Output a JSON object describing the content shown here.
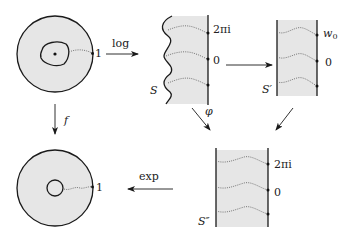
{
  "diagram": {
    "labels": {
      "log": "log",
      "exp": "exp",
      "f": "f",
      "phi": "φ",
      "one_top": "1",
      "one_bottom": "1",
      "S": "S",
      "S_prime": "S′",
      "S_double_prime": "S″",
      "two_pi_i_S": "2πi",
      "zero_S": "0",
      "w0": "w",
      "w0_sub": "0",
      "zero_Sprime": "0",
      "two_pi_i_Sdd": "2πi",
      "zero_Sdd": "0"
    },
    "nodes": [
      {
        "id": "annulus-domain",
        "description": "disk with irregular hole, marked point at center and point 1 on boundary"
      },
      {
        "id": "strip-S",
        "description": "region with wavy left boundary and straight right boundary"
      },
      {
        "id": "strip-S-prime",
        "description": "vertical strip S′"
      },
      {
        "id": "strip-S-double-prime",
        "description": "vertical strip S″"
      },
      {
        "id": "round-annulus",
        "description": "round annulus with point 1"
      }
    ],
    "edges": [
      {
        "from": "annulus-domain",
        "to": "strip-S",
        "label": "log"
      },
      {
        "from": "strip-S",
        "to": "strip-S-prime",
        "label": ""
      },
      {
        "from": "strip-S",
        "to": "strip-S-double-prime",
        "label": "φ"
      },
      {
        "from": "strip-S-prime",
        "to": "strip-S-double-prime",
        "label": ""
      },
      {
        "from": "annulus-domain",
        "to": "round-annulus",
        "label": "f"
      },
      {
        "from": "strip-S-double-prime",
        "to": "round-annulus",
        "label": "exp"
      }
    ],
    "colors": {
      "shade": "#e6e6e6",
      "ink": "#1a1a1a"
    }
  }
}
